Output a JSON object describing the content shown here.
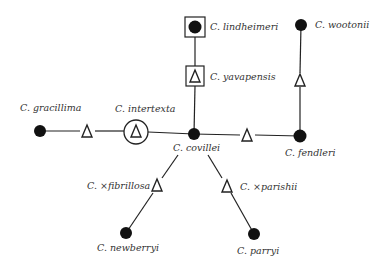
{
  "diagram": {
    "type": "species-network",
    "nodes": {
      "lindheimeri": {
        "label": "C. lindheimeri",
        "marker": "filled-circle-in-square"
      },
      "yavapensis": {
        "label": "C. yavapensis",
        "marker": "delta-in-square"
      },
      "wootonii": {
        "label": "C. wootonii",
        "marker": "filled-circle"
      },
      "gracillima": {
        "label": "C. gracillima",
        "marker": "filled-circle"
      },
      "intertexta": {
        "label": "C. intertexta",
        "marker": "delta-in-circle"
      },
      "covillei": {
        "label": "C. covillei",
        "marker": "filled-circle"
      },
      "fendleri": {
        "label": "C. fendleri",
        "marker": "filled-circle"
      },
      "fibrillosa": {
        "label": "C. ×fibrillosa",
        "marker": "delta"
      },
      "parishii": {
        "label": "C. ×parishii",
        "marker": "delta"
      },
      "newberryi": {
        "label": "C. newberryi",
        "marker": "filled-circle"
      },
      "parryi": {
        "label": "C. parryi",
        "marker": "filled-circle"
      }
    },
    "unlabeled_hybrids": [
      {
        "between": [
          "gracillima",
          "intertexta"
        ],
        "marker": "delta"
      },
      {
        "between": [
          "covillei",
          "fendleri"
        ],
        "marker": "delta"
      },
      {
        "between": [
          "wootonii",
          "fendleri"
        ],
        "marker": "delta"
      }
    ],
    "edges": [
      [
        "lindheimeri",
        "yavapensis"
      ],
      [
        "yavapensis",
        "covillei"
      ],
      [
        "gracillima",
        "intertexta"
      ],
      [
        "intertexta",
        "covillei"
      ],
      [
        "covillei",
        "fendleri"
      ],
      [
        "wootonii",
        "fendleri"
      ],
      [
        "covillei",
        "fibrillosa"
      ],
      [
        "fibrillosa",
        "newberryi"
      ],
      [
        "covillei",
        "parishii"
      ],
      [
        "parishii",
        "parryi"
      ]
    ],
    "legend_symbols": {
      "filled_circle": "●",
      "delta": "Δ"
    }
  }
}
